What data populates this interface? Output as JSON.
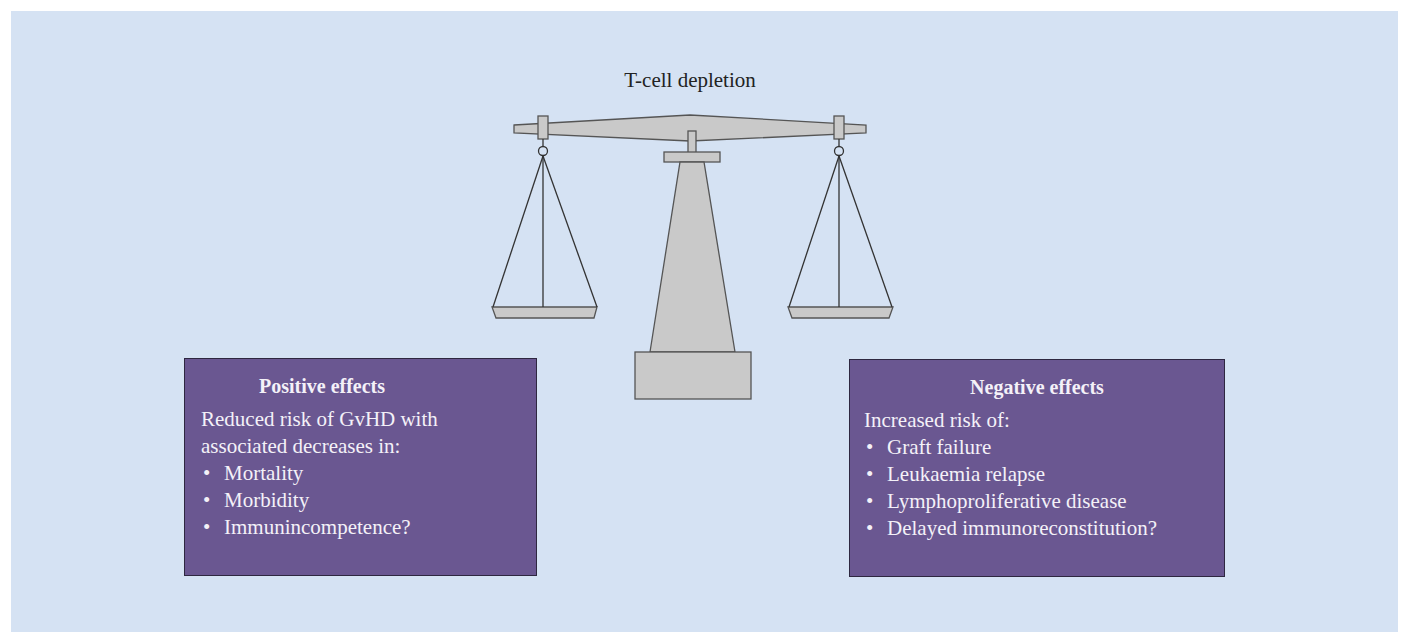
{
  "diagram": {
    "title": "T-cell depletion",
    "colors": {
      "background": "#d5e2f3",
      "scale_fill": "#c9c9c9",
      "scale_stroke": "#555555",
      "box_fill": "#6a5791",
      "box_text": "#f4f1f8"
    },
    "scale": {
      "icon": "balance-scale-icon"
    },
    "positive": {
      "heading": "Positive effects",
      "intro_line1": "Reduced risk of GvHD with",
      "intro_line2": "associated decreases in:",
      "bullet": "•",
      "items": [
        "Mortality",
        "Morbidity",
        "Immunincompetence?"
      ]
    },
    "negative": {
      "heading": "Negative effects",
      "intro": "Increased risk of:",
      "bullet": "•",
      "items": [
        "Graft failure",
        "Leukaemia relapse",
        "Lymphoproliferative disease",
        "Delayed immunoreconstitution?"
      ]
    }
  }
}
